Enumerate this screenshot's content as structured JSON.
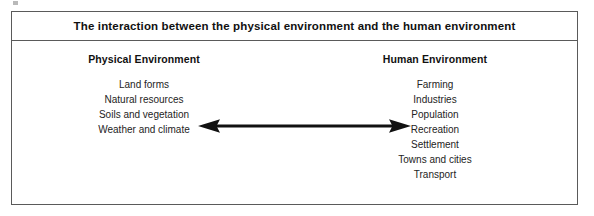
{
  "figure": {
    "title": "The interaction between the physical environment and the human environment",
    "border_color": "#5a5a5a",
    "background_color": "#ffffff",
    "text_color": "#242424"
  },
  "left_column": {
    "heading": "Physical Environment",
    "items": [
      "Land forms",
      "Natural resources",
      "Soils and vegetation",
      "Weather and climate"
    ]
  },
  "right_column": {
    "heading": "Human Environment",
    "items": [
      "Farming",
      "Industries",
      "Population",
      "Recreation",
      "Settlement",
      "Towns and cities",
      "Transport"
    ]
  },
  "connector": {
    "name": "double-headed-arrow",
    "direction": "bidirectional",
    "orientation": "horizontal",
    "color": "#111111"
  }
}
